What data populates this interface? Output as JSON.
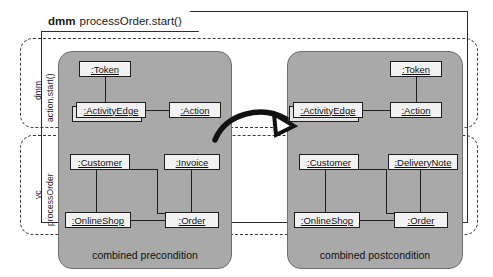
{
  "diagram": {
    "frame_title_keyword": "dmm",
    "frame_title_text": "processOrder.start()",
    "arrow_name": "transformation-arrow"
  },
  "lanes": [
    {
      "id": "lane-dmm",
      "label_top": "dmm",
      "label_bottom": "action.start()"
    },
    {
      "id": "lane-vc",
      "label_top": "vc",
      "label_bottom": "processOrder"
    }
  ],
  "panels": [
    {
      "id": "precondition",
      "caption": "combined precondition",
      "nodes": {
        "token": ":Token",
        "activity_edge": ":ActivityEdge",
        "action": ":Action",
        "customer": ":Customer",
        "invoice": ":Invoice",
        "online_shop": ":OnlineShop",
        "order": ":Order"
      }
    },
    {
      "id": "postcondition",
      "caption": "combined postcondition",
      "nodes": {
        "token": ":Token",
        "activity_edge": ":ActivityEdge",
        "action": ":Action",
        "customer": ":Customer",
        "delivery_note": ":DeliveryNote",
        "online_shop": ":OnlineShop",
        "order": ":Order"
      }
    }
  ],
  "colors": {
    "panel_fill": "#a9a9a9",
    "node_fill": "#f2f2f2",
    "stroke": "#1d1d1d",
    "background": "#ffffff"
  }
}
